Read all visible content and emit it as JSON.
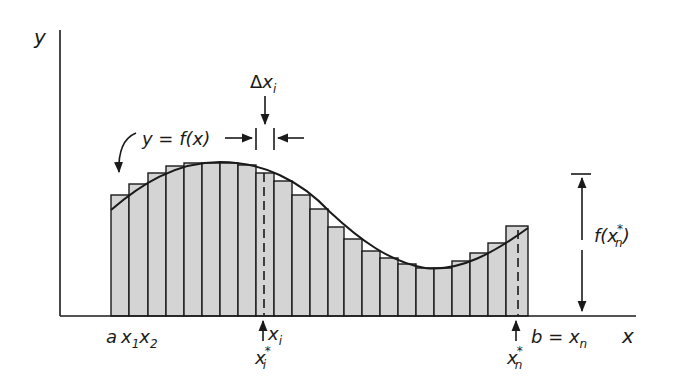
{
  "diagram": {
    "colors": {
      "ink": "#1a1a1a",
      "bar_fill": "#d4d4d4",
      "background": "#ffffff"
    },
    "axes": {
      "x_label": "x",
      "y_label": "y"
    },
    "curve_label": "y = f(x)",
    "delta_label": {
      "delta": "Δ",
      "x": "x",
      "sub": "i"
    },
    "height_label": {
      "f": "f(",
      "x": "x",
      "sub": "n",
      "sup": "*",
      "close": ")"
    },
    "bottom_labels": {
      "a": "a",
      "x1": {
        "x": "x",
        "sub": "1"
      },
      "x2": {
        "x": "x",
        "sub": "2"
      },
      "xi": {
        "x": "x",
        "sub": "i"
      },
      "xi_star": {
        "x": "x",
        "sub": "i",
        "sup": "*"
      },
      "b_eq": "b = ",
      "xn": {
        "x": "x",
        "sub": "n"
      },
      "xn_star": {
        "x": "x",
        "sub": "n",
        "sup": "*"
      }
    },
    "bars": [
      {
        "x0": 111,
        "x1": 129,
        "top": 195
      },
      {
        "x0": 129,
        "x1": 148,
        "top": 184
      },
      {
        "x0": 148,
        "x1": 166,
        "top": 173
      },
      {
        "x0": 166,
        "x1": 184,
        "top": 166
      },
      {
        "x0": 184,
        "x1": 202,
        "top": 163
      },
      {
        "x0": 202,
        "x1": 220,
        "top": 163
      },
      {
        "x0": 220,
        "x1": 238,
        "top": 163
      },
      {
        "x0": 238,
        "x1": 256,
        "top": 165
      },
      {
        "x0": 256,
        "x1": 274,
        "top": 173
      },
      {
        "x0": 274,
        "x1": 292,
        "top": 181
      },
      {
        "x0": 292,
        "x1": 310,
        "top": 195
      },
      {
        "x0": 310,
        "x1": 328,
        "top": 209
      },
      {
        "x0": 328,
        "x1": 344,
        "top": 227
      },
      {
        "x0": 344,
        "x1": 362,
        "top": 239
      },
      {
        "x0": 362,
        "x1": 380,
        "top": 251
      },
      {
        "x0": 380,
        "x1": 398,
        "top": 258
      },
      {
        "x0": 398,
        "x1": 416,
        "top": 264
      },
      {
        "x0": 416,
        "x1": 434,
        "top": 268
      },
      {
        "x0": 434,
        "x1": 452,
        "top": 268
      },
      {
        "x0": 452,
        "x1": 470,
        "top": 261
      },
      {
        "x0": 470,
        "x1": 488,
        "top": 253
      },
      {
        "x0": 488,
        "x1": 506,
        "top": 243
      },
      {
        "x0": 506,
        "x1": 528,
        "top": 226
      }
    ]
  }
}
